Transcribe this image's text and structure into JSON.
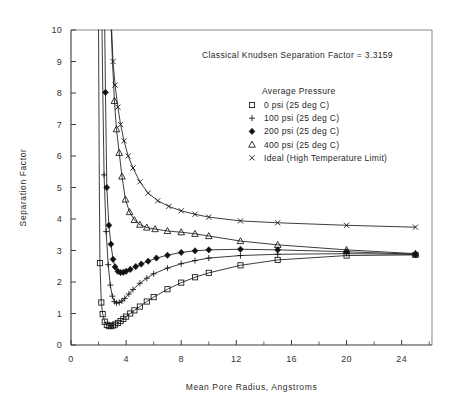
{
  "chart_data": {
    "type": "line",
    "title": "",
    "xlabel": "Mean Pore Radius, Angstroms",
    "ylabel": "Separation Factor",
    "xlim": [
      0,
      26.2
    ],
    "ylim": [
      0,
      10
    ],
    "xticks": [
      0,
      4,
      8,
      12,
      16,
      20,
      24
    ],
    "xticks_minor": [
      2,
      6,
      10,
      14,
      18,
      22,
      26
    ],
    "yticks": [
      0,
      1,
      2,
      3,
      4,
      5,
      6,
      7,
      8,
      9,
      10
    ],
    "grid": false,
    "legend_position": "upper-right",
    "legend_title": "Average Pressure",
    "annotation": "Classical Knudsen Separation Factor = 3.3159",
    "series": [
      {
        "name": "0 psi (25 deg C)",
        "marker": "square",
        "legend_label": "0 psi (25 deg C)",
        "x": [
          2.0,
          2.05,
          2.1,
          2.2,
          2.3,
          2.45,
          2.6,
          2.75,
          2.9,
          3.05,
          3.2,
          3.4,
          3.6,
          3.8,
          4.0,
          4.3,
          4.6,
          5.0,
          5.5,
          6.0,
          7.0,
          8.0,
          9.0,
          10.0,
          12.3,
          15.0,
          20.0,
          25.0
        ],
        "y": [
          10.0,
          5.4,
          2.6,
          1.35,
          0.98,
          0.74,
          0.64,
          0.6,
          0.6,
          0.62,
          0.65,
          0.7,
          0.76,
          0.83,
          0.9,
          1.0,
          1.1,
          1.22,
          1.38,
          1.52,
          1.77,
          1.98,
          2.15,
          2.29,
          2.53,
          2.7,
          2.84,
          2.86
        ],
        "marker_x": [
          2.1,
          2.2,
          2.3,
          2.45,
          2.6,
          2.75,
          2.9,
          3.05,
          3.2,
          3.4,
          3.6,
          3.8,
          4.0,
          4.3,
          4.6,
          5.0,
          5.5,
          6.0,
          7.0,
          8.0,
          9.0,
          10.0,
          12.3,
          15.0,
          20.0,
          25.0
        ],
        "marker_y": [
          2.6,
          1.35,
          0.98,
          0.74,
          0.64,
          0.6,
          0.6,
          0.62,
          0.65,
          0.7,
          0.76,
          0.83,
          0.9,
          1.0,
          1.1,
          1.22,
          1.38,
          1.52,
          1.77,
          1.98,
          2.15,
          2.29,
          2.53,
          2.7,
          2.84,
          2.86
        ]
      },
      {
        "name": "100 psi (25 deg C)",
        "marker": "plus",
        "legend_label": "100 psi (25 deg C)",
        "x": [
          2.25,
          2.3,
          2.4,
          2.55,
          2.7,
          2.85,
          3.0,
          3.15,
          3.3,
          3.5,
          3.7,
          3.9,
          4.2,
          4.5,
          5.0,
          5.5,
          6.0,
          7.0,
          8.0,
          9.0,
          10.0,
          12.3,
          15.0,
          20.0,
          25.0
        ],
        "y": [
          10.0,
          8.3,
          5.4,
          3.6,
          2.55,
          1.9,
          1.55,
          1.38,
          1.33,
          1.35,
          1.4,
          1.48,
          1.62,
          1.76,
          1.96,
          2.12,
          2.26,
          2.44,
          2.58,
          2.68,
          2.76,
          2.84,
          2.88,
          2.9,
          2.88
        ],
        "marker_x": [
          2.4,
          2.55,
          2.7,
          2.85,
          3.0,
          3.15,
          3.3,
          3.5,
          3.7,
          3.9,
          4.2,
          4.5,
          5.0,
          5.5,
          6.0,
          7.0,
          8.0,
          9.0,
          10.0,
          12.3,
          15.0,
          20.0,
          25.0
        ],
        "marker_y": [
          5.4,
          3.6,
          2.55,
          1.9,
          1.55,
          1.38,
          1.33,
          1.35,
          1.4,
          1.48,
          1.62,
          1.76,
          1.96,
          2.12,
          2.26,
          2.44,
          2.58,
          2.68,
          2.76,
          2.84,
          2.88,
          2.9,
          2.88
        ]
      },
      {
        "name": "200 psi (25 deg C)",
        "marker": "diamond",
        "legend_label": "200 psi (25 deg C)",
        "x": [
          2.45,
          2.5,
          2.6,
          2.75,
          2.9,
          3.05,
          3.2,
          3.4,
          3.6,
          3.8,
          4.0,
          4.3,
          4.7,
          5.1,
          5.6,
          6.2,
          7.0,
          8.0,
          9.0,
          10.0,
          12.3,
          15.0,
          20.0,
          25.0
        ],
        "y": [
          10.0,
          8.02,
          5.0,
          3.8,
          3.2,
          2.72,
          2.48,
          2.34,
          2.3,
          2.31,
          2.34,
          2.4,
          2.49,
          2.57,
          2.66,
          2.76,
          2.85,
          2.94,
          2.99,
          3.02,
          3.04,
          3.02,
          2.96,
          2.88
        ],
        "marker_x": [
          2.5,
          2.6,
          2.75,
          2.9,
          3.05,
          3.2,
          3.4,
          3.6,
          3.8,
          4.0,
          4.3,
          4.7,
          5.1,
          5.6,
          6.2,
          7.0,
          8.0,
          9.0,
          10.0,
          12.3,
          15.0,
          20.0,
          25.0
        ],
        "marker_y": [
          8.02,
          5.0,
          3.8,
          3.2,
          2.72,
          2.48,
          2.34,
          2.3,
          2.31,
          2.34,
          2.4,
          2.49,
          2.57,
          2.66,
          2.76,
          2.85,
          2.94,
          2.99,
          3.02,
          3.04,
          3.02,
          2.96,
          2.88
        ]
      },
      {
        "name": "400 psi (25 deg C)",
        "marker": "triangle",
        "legend_label": "400 psi (25 deg C)",
        "x": [
          2.92,
          3.0,
          3.15,
          3.3,
          3.5,
          3.7,
          3.95,
          4.25,
          4.6,
          5.0,
          5.5,
          6.1,
          7.0,
          8.0,
          9.0,
          10.0,
          12.3,
          15.0,
          20.0,
          25.0
        ],
        "y": [
          10.0,
          9.1,
          7.75,
          6.85,
          6.1,
          5.35,
          4.62,
          4.22,
          3.97,
          3.82,
          3.73,
          3.68,
          3.62,
          3.58,
          3.53,
          3.46,
          3.3,
          3.18,
          3.02,
          2.9
        ],
        "marker_x": [
          3.15,
          3.3,
          3.5,
          3.7,
          3.95,
          4.25,
          4.6,
          5.0,
          5.5,
          6.1,
          7.0,
          8.0,
          9.0,
          10.0,
          12.3,
          15.0,
          20.0,
          25.0
        ],
        "marker_y": [
          7.75,
          6.85,
          6.1,
          5.35,
          4.62,
          4.22,
          3.97,
          3.82,
          3.73,
          3.68,
          3.62,
          3.58,
          3.53,
          3.46,
          3.3,
          3.18,
          3.02,
          2.9
        ]
      },
      {
        "name": "Ideal (High Temperature Limit)",
        "marker": "cross",
        "legend_label": "Ideal (High Temperature Limit)",
        "x": [
          2.95,
          3.05,
          3.2,
          3.4,
          3.6,
          3.85,
          4.15,
          4.5,
          5.0,
          5.6,
          6.3,
          7.1,
          8.0,
          9.0,
          10.0,
          12.3,
          15.0,
          20.0,
          25.0
        ],
        "y": [
          10.0,
          9.0,
          8.25,
          7.55,
          7.0,
          6.48,
          6.0,
          5.62,
          5.18,
          4.82,
          4.58,
          4.4,
          4.26,
          4.15,
          4.06,
          3.94,
          3.88,
          3.8,
          3.74
        ],
        "marker_x": [
          3.05,
          3.2,
          3.4,
          3.6,
          3.85,
          4.15,
          4.5,
          5.0,
          5.6,
          6.3,
          7.1,
          8.0,
          9.0,
          10.0,
          12.3,
          15.0,
          20.0,
          25.0
        ],
        "marker_y": [
          9.0,
          8.25,
          7.55,
          7.0,
          6.48,
          6.0,
          5.62,
          5.18,
          4.82,
          4.58,
          4.4,
          4.26,
          4.15,
          4.06,
          3.94,
          3.88,
          3.8,
          3.74
        ]
      }
    ]
  },
  "legend": {
    "title": "Average Pressure",
    "entries": [
      {
        "marker": "square",
        "label": "0 psi (25 deg C)"
      },
      {
        "marker": "plus",
        "label": "100 psi (25 deg C)"
      },
      {
        "marker": "diamond",
        "label": "200 psi (25 deg C)"
      },
      {
        "marker": "triangle",
        "label": "400 psi (25 deg C)"
      },
      {
        "marker": "cross",
        "label": "Ideal (High Temperature Limit)"
      }
    ]
  },
  "colors": {
    "ink": "#1a1a1a",
    "axis": "#3a3a3a",
    "frame": "#777777",
    "background": "#ffffff"
  }
}
